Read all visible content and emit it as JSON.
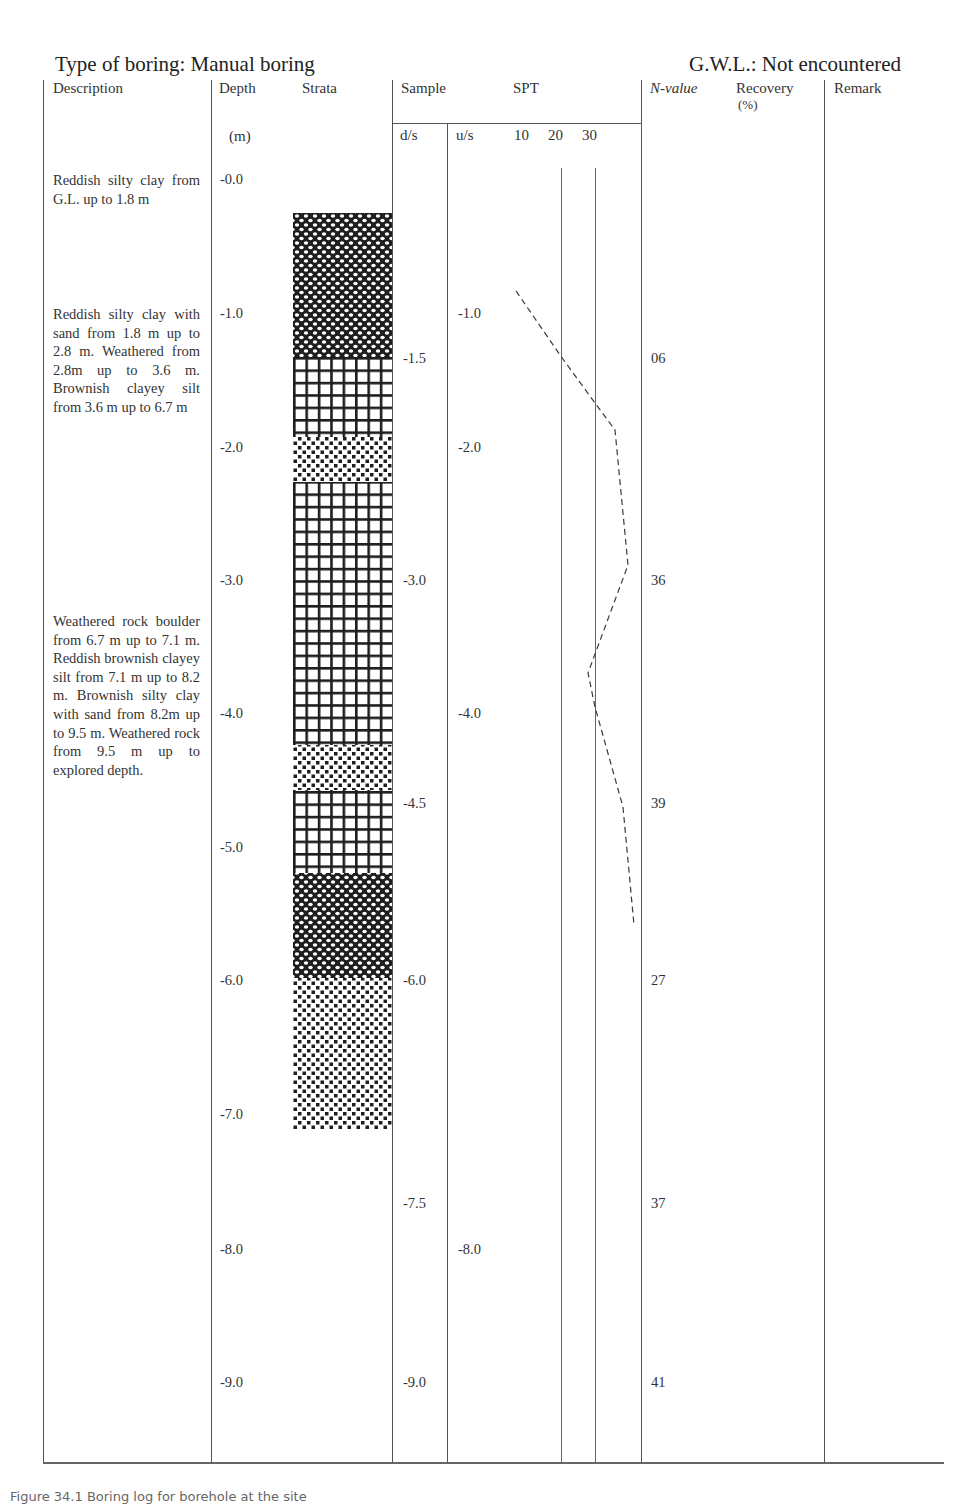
{
  "header": {
    "boring_type": "Type of boring: Manual boring",
    "gwl": "G.W.L.: Not encountered"
  },
  "columns": {
    "description": "Description",
    "depth": "Depth",
    "depth_unit": "(m)",
    "strata": "Strata",
    "sample": "Sample",
    "spt": "SPT",
    "ds": "d/s",
    "us": "u/s",
    "spt_ticks": [
      "10",
      "20",
      "30"
    ],
    "n_value": "N-value",
    "recovery": "Recovery",
    "recovery_unit": "(%)",
    "remark": "Remark"
  },
  "descriptions": [
    "Reddish silty clay from G.L. up to 1.8 m",
    "Reddish silty clay with sand from 1.8 m up to 2.8 m. Weathered from 2.8m up to 3.6 m. Brownish clayey silt from 3.6 m up to 6.7 m",
    "Weathered rock boulder from 6.7 m up to 7.1 m. Reddish brownish clayey silt from 7.1 m up to 8.2 m. Brownish silty clay with sand from 8.2m up to 9.5 m. Weathered rock from 9.5 m up to explored depth."
  ],
  "depth_labels": [
    "-0.0",
    "-1.0",
    "-2.0",
    "-3.0",
    "-4.0",
    "-5.0",
    "-6.0",
    "-7.0",
    "-8.0",
    "-9.0"
  ],
  "disturbed_samples": [
    "-1.5",
    "-3.0",
    "-4.5",
    "-6.0",
    "-7.5",
    "-9.0"
  ],
  "undisturbed_samples": [
    "-1.0",
    "-2.0",
    "-4.0",
    "-8.0"
  ],
  "n_values": [
    "06",
    "36",
    "39",
    "27",
    "37",
    "41"
  ],
  "strata_layers": [
    {
      "pattern": "dense-crosshatch",
      "top_px": 213,
      "bottom_px": 357
    },
    {
      "pattern": "grid",
      "top_px": 357,
      "bottom_px": 437
    },
    {
      "pattern": "checker",
      "top_px": 437,
      "bottom_px": 482
    },
    {
      "pattern": "grid",
      "top_px": 482,
      "bottom_px": 745
    },
    {
      "pattern": "checker",
      "top_px": 745,
      "bottom_px": 790
    },
    {
      "pattern": "grid",
      "top_px": 790,
      "bottom_px": 873
    },
    {
      "pattern": "dense-crosshatch",
      "top_px": 873,
      "bottom_px": 978
    },
    {
      "pattern": "checker",
      "top_px": 978,
      "bottom_px": 1130
    }
  ],
  "spt_curve_points": "516,291 560,355 595,403 615,430 628,565 588,673 595,707 623,807 634,925",
  "caption": "Figure 34.1 Boring log for borehole at the site"
}
